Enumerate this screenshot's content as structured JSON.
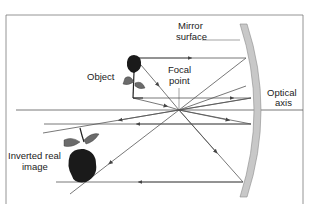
{
  "diagram": {
    "type": "concave-mirror-ray-diagram",
    "labels": {
      "mirror_surface_1": "Mirror",
      "mirror_surface_2": "surface",
      "object": "Object",
      "focal_point_1": "Focal",
      "focal_point_2": "point",
      "optical_axis_1": "Optical",
      "optical_axis_2": "axis",
      "image_1": "Inverted real",
      "image_2": "image"
    },
    "colors": {
      "frame": "#7a7a7a",
      "ray": "#555555",
      "mirror_fill": "#c8c8c8",
      "mirror_edge": "#8a8a8a",
      "flower": "#1a1a1a",
      "leaf": "#6b6b6b"
    }
  }
}
